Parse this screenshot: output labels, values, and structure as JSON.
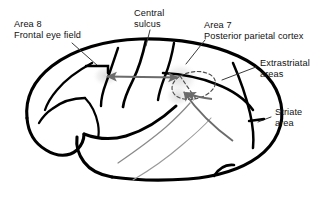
{
  "figure": {
    "name": "lateral-view-brain-visual-attention-pathways",
    "background_color": "#ffffff",
    "outline_color": "#000000",
    "arrow_color": "#6b6b6b",
    "dashed_color": "#4d4d4d",
    "leader_color": "#3a3a3a",
    "halo_color": "#e8e8e8"
  },
  "labels": {
    "area8": {
      "line1": "Area 8",
      "line2": "Frontal eye field"
    },
    "central_sulcus": {
      "line1": "Central",
      "line2": "sulcus"
    },
    "area7": {
      "line1": "Area 7",
      "line2": "Posterior parietal cortex"
    },
    "extrastriatal": {
      "line1": "Extrastriatal",
      "line2": "areas"
    },
    "striate": {
      "line1": "Striate",
      "line2": "area"
    }
  },
  "connections": [
    {
      "name": "frontal-eye-field-to-parietal",
      "type": "double-headed-arrow",
      "from": "Area 8 Frontal eye field",
      "to": "Area 7 Posterior parietal cortex"
    },
    {
      "name": "extrastriatal-to-parietal",
      "type": "single-headed-arrow",
      "from": "Extrastriatal areas",
      "to": "Area 7 Posterior parietal cortex"
    },
    {
      "name": "striate-to-parietal",
      "type": "single-headed-arrow",
      "from": "Striate area",
      "to": "Area 7 Posterior parietal cortex"
    }
  ]
}
